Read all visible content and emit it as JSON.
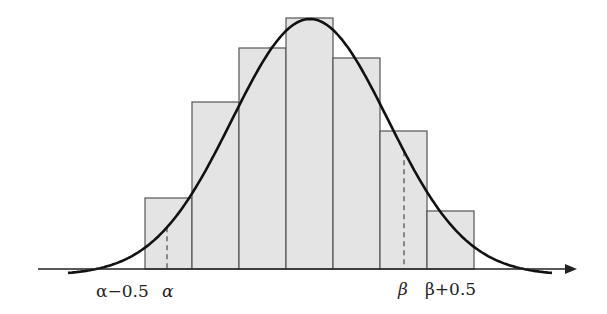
{
  "chart_data": {
    "type": "bar",
    "bars": [
      {
        "x0": 145,
        "x1": 192,
        "top": 198
      },
      {
        "x0": 192,
        "x1": 239,
        "top": 102
      },
      {
        "x0": 239,
        "x1": 286,
        "top": 48
      },
      {
        "x0": 286,
        "x1": 333,
        "top": 18
      },
      {
        "x0": 333,
        "x1": 380,
        "top": 58
      },
      {
        "x0": 380,
        "x1": 427,
        "top": 131
      },
      {
        "x0": 427,
        "x1": 474,
        "top": 211
      }
    ],
    "relative_heights": [
      71,
      167,
      221,
      251,
      211,
      138,
      58
    ],
    "curve": {
      "type": "normal",
      "mean_x": 310,
      "peak_y": 19,
      "sigma_px": 78,
      "x_start": 68,
      "x_end": 552
    },
    "dashed_markers": [
      {
        "label": "α",
        "x": 167
      },
      {
        "label": "β",
        "x": 404
      }
    ],
    "axis": {
      "y": 269,
      "x_start": 38,
      "x_end": 577,
      "arrow": true
    },
    "tick_labels": [
      "α−0.5",
      "α",
      "β",
      "β+0.5"
    ],
    "xlabel": "",
    "ylabel": "",
    "title": ""
  },
  "labels": {
    "alpha_minus": "α−0.5",
    "alpha": "α",
    "beta": "β",
    "beta_plus": "β+0.5"
  },
  "colors": {
    "bar_fill": "#e4e4e4",
    "bar_stroke": "#555555",
    "curve": "#111111",
    "axis": "#222222"
  }
}
